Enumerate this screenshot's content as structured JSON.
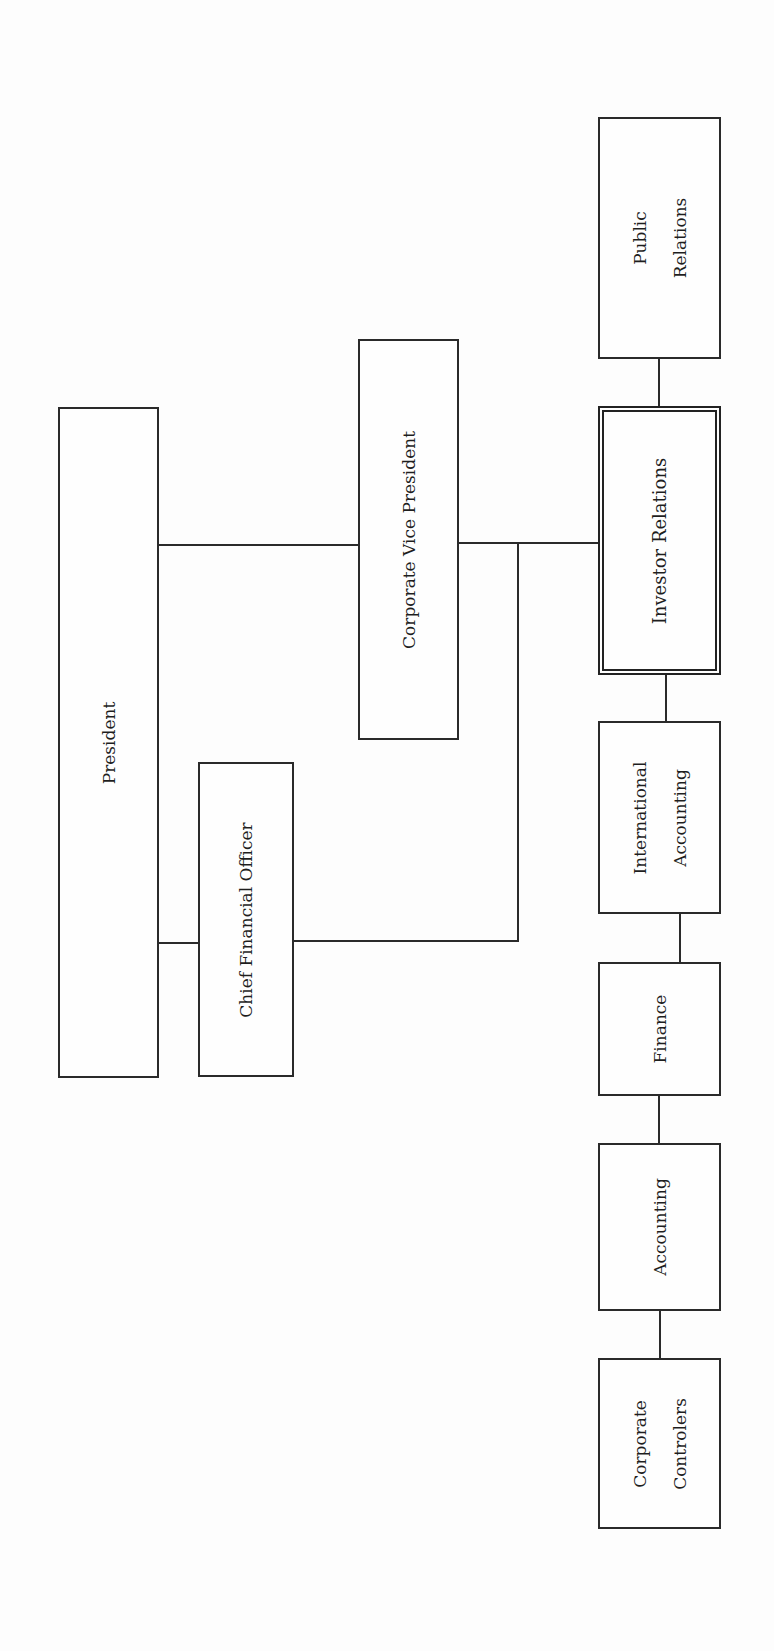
{
  "diagram": {
    "type": "org-chart",
    "orientation": "rotated-90-ccw",
    "nodes": [
      {
        "id": "president",
        "label_lines": [
          "President"
        ],
        "x": 58,
        "y": 407,
        "w": 101,
        "h": 671,
        "style": "single"
      },
      {
        "id": "cfo",
        "label_lines": [
          "Chief Financial Officer"
        ],
        "x": 198,
        "y": 762,
        "w": 96,
        "h": 315,
        "style": "single"
      },
      {
        "id": "cvp",
        "label_lines": [
          "Corporate Vice President"
        ],
        "x": 358,
        "y": 339,
        "w": 101,
        "h": 401,
        "style": "single"
      },
      {
        "id": "public-relations",
        "label_lines": [
          "Public",
          "Relations"
        ],
        "x": 598,
        "y": 117,
        "w": 123,
        "h": 242,
        "style": "single"
      },
      {
        "id": "investor-relations",
        "label_lines": [
          "Investor Relations"
        ],
        "x": 598,
        "y": 406,
        "w": 123,
        "h": 269,
        "style": "double"
      },
      {
        "id": "international-accounting",
        "label_lines": [
          "International",
          "Accounting"
        ],
        "x": 598,
        "y": 721,
        "w": 123,
        "h": 193,
        "style": "single"
      },
      {
        "id": "finance",
        "label_lines": [
          "Finance"
        ],
        "x": 598,
        "y": 962,
        "w": 123,
        "h": 134,
        "style": "single"
      },
      {
        "id": "accounting",
        "label_lines": [
          "Accounting"
        ],
        "x": 598,
        "y": 1143,
        "w": 123,
        "h": 168,
        "style": "single"
      },
      {
        "id": "corporate-controlers",
        "label_lines": [
          "Corporate",
          "Controlers"
        ],
        "x": 598,
        "y": 1358,
        "w": 123,
        "h": 171,
        "style": "single"
      }
    ],
    "connectors": [
      {
        "id": "president-to-cvp",
        "dir": "h",
        "x": 158,
        "y": 544,
        "len": 201
      },
      {
        "id": "president-to-cfo",
        "dir": "h",
        "x": 158,
        "y": 942,
        "len": 41
      },
      {
        "id": "cvp-to-investor-relations",
        "dir": "h",
        "x": 458,
        "y": 542,
        "len": 141
      },
      {
        "id": "cfo-to-trunk",
        "dir": "h",
        "x": 293,
        "y": 940,
        "len": 226
      },
      {
        "id": "trunk-vertical",
        "dir": "v",
        "x": 517,
        "y": 542,
        "len": 400
      },
      {
        "id": "public-to-investor",
        "dir": "v",
        "x": 658,
        "y": 358,
        "len": 49
      },
      {
        "id": "investor-to-intl",
        "dir": "v",
        "x": 665,
        "y": 674,
        "len": 48
      },
      {
        "id": "intl-to-finance",
        "dir": "v",
        "x": 679,
        "y": 913,
        "len": 50
      },
      {
        "id": "finance-to-accounting",
        "dir": "v",
        "x": 658,
        "y": 1095,
        "len": 49
      },
      {
        "id": "accounting-to-controlers",
        "dir": "v",
        "x": 659,
        "y": 1310,
        "len": 49
      }
    ]
  },
  "labels": {
    "president": "President",
    "cfo": "Chief Financial Officer",
    "cvp": "Corporate Vice President",
    "public_relations_1": "Public",
    "public_relations_2": "Relations",
    "investor_relations": "Investor Relations",
    "intl_accounting_1": "International",
    "intl_accounting_2": "Accounting",
    "finance": "Finance",
    "accounting": "Accounting",
    "corporate_controlers_1": "Corporate",
    "corporate_controlers_2": "Controlers"
  },
  "colors": {
    "line": "#2a2a2a",
    "background": "#fdfdfd",
    "text": "#1e1e1e"
  }
}
